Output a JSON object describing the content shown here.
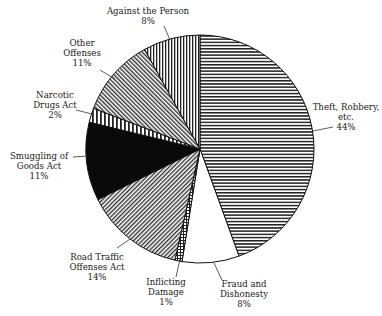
{
  "chart_data": {
    "type": "pie",
    "title": "",
    "start_angle_deg": 0,
    "direction": "clockwise",
    "slices": [
      {
        "label": "Theft, Robbery, etc.",
        "value": 44,
        "pct_text": "44%",
        "pattern": "horizontal",
        "label_lines": [
          "Theft, Robbery,",
          "etc.",
          "44%"
        ]
      },
      {
        "label": "Fraud and Dishonesty",
        "value": 8,
        "pct_text": "8%",
        "pattern": "blank",
        "label_lines": [
          "Fraud and",
          "Dishonesty",
          "8%"
        ]
      },
      {
        "label": "Inflicting Damage",
        "value": 1,
        "pct_text": "1%",
        "pattern": "crosshatch",
        "label_lines": [
          "Inflicting",
          "Damage",
          "1%"
        ]
      },
      {
        "label": "Road Traffic Offenses Act",
        "value": 14,
        "pct_text": "14%",
        "pattern": "diag-forward",
        "label_lines": [
          "Road Traffic",
          "Offenses Act",
          "14%"
        ]
      },
      {
        "label": "Smuggling of Goods Act",
        "value": 11,
        "pct_text": "11%",
        "pattern": "solid-black",
        "label_lines": [
          "Smuggling of",
          "Goods Act",
          "11%"
        ]
      },
      {
        "label": "Narcotic Drugs Act",
        "value": 2,
        "pct_text": "2%",
        "pattern": "vertical-wide",
        "label_lines": [
          "Narcotic",
          "Drugs Act",
          "2%"
        ]
      },
      {
        "label": "Other Offenses",
        "value": 11,
        "pct_text": "11%",
        "pattern": "diag-back",
        "label_lines": [
          "Other",
          "Offenses",
          "11%"
        ]
      },
      {
        "label": "Against the Person",
        "value": 8,
        "pct_text": "8%",
        "pattern": "vertical",
        "label_lines": [
          "Against the Person",
          "8%"
        ]
      }
    ],
    "legend": "none (callout labels)",
    "grid": false
  },
  "labels": {
    "theft": {
      "l1": "Theft, Robbery,",
      "l2": "etc.",
      "l3": "44%"
    },
    "fraud": {
      "l1": "Fraud and",
      "l2": "Dishonesty",
      "l3": "8%"
    },
    "inflicting": {
      "l1": "Inflicting",
      "l2": "Damage",
      "l3": "1%"
    },
    "road": {
      "l1": "Road Traffic",
      "l2": "Offenses Act",
      "l3": "14%"
    },
    "smuggling": {
      "l1": "Smuggling of",
      "l2": "Goods Act",
      "l3": "11%"
    },
    "narcotic": {
      "l1": "Narcotic",
      "l2": "Drugs Act",
      "l3": "2%"
    },
    "other": {
      "l1": "Other",
      "l2": "Offenses",
      "l3": "11%"
    },
    "person": {
      "l1": "Against the Person",
      "l2": "8%"
    }
  }
}
